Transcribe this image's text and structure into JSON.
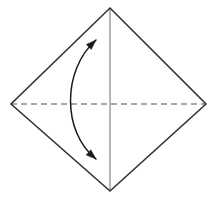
{
  "figure": {
    "title": "Origami fold step diagram",
    "canvas": {
      "width": 217,
      "height": 197,
      "background": "#ffffff"
    }
  },
  "colors": {
    "paper_outline": "#33333a",
    "solid_crease": "#7a7a80",
    "dashed_crease": "#8a8a90",
    "arrow": "#1a1a1a",
    "background": "#ffffff"
  },
  "shapes": {
    "paper": {
      "name": "square-sheet-diamond",
      "kind": "polygon",
      "stroke_width": 1.6,
      "fill": "none",
      "vertices": [
        {
          "label": "top",
          "x": 110,
          "y": 8
        },
        {
          "label": "right",
          "x": 206,
          "y": 104
        },
        {
          "label": "bottom",
          "x": 110,
          "y": 191
        },
        {
          "label": "left",
          "x": 11,
          "y": 104
        }
      ]
    },
    "vertical_line": {
      "name": "vertical-crease-line",
      "kind": "line",
      "style": "solid",
      "stroke_width": 1.1,
      "x1": 110,
      "y1": 8,
      "x2": 110,
      "y2": 191
    },
    "horizontal_line": {
      "name": "horizontal-dashed-crease-line",
      "kind": "line",
      "style": "dashed",
      "dash_length": 6,
      "dash_gap": 4,
      "stroke_width": 1.4,
      "x1": 11,
      "y1": 104,
      "x2": 206,
      "y2": 104
    },
    "fold_arrow": {
      "name": "curved-double-headed-fold-arrow",
      "kind": "curve",
      "style": "solid",
      "stroke_width": 1.5,
      "heads": "both",
      "head_length": 10,
      "head_width": 7,
      "path": "M 96 40 C 62 70, 62 132, 96 159",
      "start_point": {
        "x": 96,
        "y": 40
      },
      "end_point": {
        "x": 96,
        "y": 159
      },
      "bulge_point": {
        "x": 70,
        "y": 100
      },
      "direction": "bidirectional"
    }
  },
  "legend": {
    "solid_line_meaning": "fold line",
    "dashed_line_meaning": "valley crease (existing fold)",
    "arrow_meaning": "fold and unfold"
  }
}
